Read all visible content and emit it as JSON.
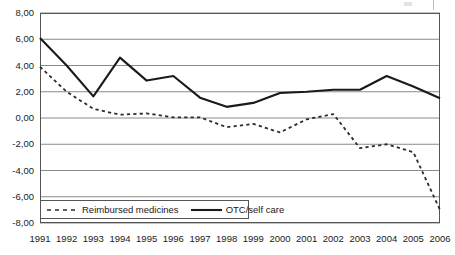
{
  "chart_data": {
    "type": "line",
    "title": "",
    "subtitle": "",
    "xlabel": "",
    "ylabel": "",
    "categories": [
      "1991",
      "1992",
      "1993",
      "1994",
      "1995",
      "1996",
      "1997",
      "1998",
      "1999",
      "2000",
      "2001",
      "2002",
      "2003",
      "2004",
      "2005",
      "2006"
    ],
    "series": [
      {
        "name": "Reimbursed medicines",
        "style": "dashed",
        "color": "#2b2b2b",
        "values": [
          3.9,
          2.0,
          0.7,
          0.25,
          0.35,
          0.05,
          0.05,
          -0.7,
          -0.45,
          -1.1,
          -0.1,
          0.3,
          -2.3,
          -2.0,
          -2.6,
          -7.0
        ]
      },
      {
        "name": "OTC/self care",
        "style": "solid",
        "color": "#1a1a1a",
        "values": [
          6.1,
          4.0,
          1.65,
          4.6,
          2.85,
          3.2,
          1.55,
          0.85,
          1.15,
          1.9,
          2.0,
          2.15,
          2.15,
          3.2,
          2.4,
          1.5
        ]
      }
    ],
    "ylim": [
      -8.0,
      8.0
    ],
    "ytick_labels": [
      "8,00",
      "6,00",
      "4,00",
      "2,00",
      "0,00",
      "-2,00",
      "-4,00",
      "-6,00",
      "-8,00"
    ],
    "ytick_values": [
      8,
      6,
      4,
      2,
      0,
      -2,
      -4,
      -6,
      -8
    ],
    "grid": true,
    "grid_axis": "y",
    "legend_position": "bottom-left",
    "decimal_separator": ","
  },
  "legend": {
    "entries": [
      {
        "label": "Reimbursed medicines",
        "icon": "dashed-line-swatch"
      },
      {
        "label": "OTC/self care",
        "icon": "solid-line-swatch"
      }
    ]
  },
  "colors": {
    "plot_border": "#555555",
    "gridline": "#8a8a8a",
    "series_dashed": "#2b2b2b",
    "series_solid": "#1a1a1a",
    "background": "#ffffff",
    "text": "#1a1a1a"
  }
}
